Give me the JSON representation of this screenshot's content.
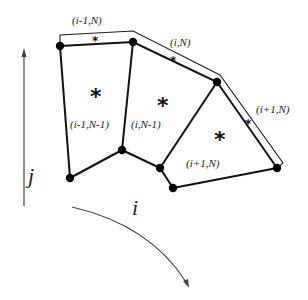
{
  "diagram": {
    "type": "finite-volume-grid-cells",
    "axes": {
      "j_label": "j",
      "i_label": "i"
    },
    "cells": [
      {
        "label": "(i-1,N-1)",
        "center_marker": "*"
      },
      {
        "label": "(i,N-1)",
        "center_marker": "*"
      },
      {
        "label": "(i+1,N)",
        "center_marker": "*"
      }
    ],
    "boundary_strips": [
      {
        "label": "(i-1,N)",
        "marker": "*"
      },
      {
        "label": "(i,N)",
        "marker": "*"
      },
      {
        "label": "(i+1,N)",
        "marker": "*"
      }
    ],
    "colors": {
      "line": "#111111",
      "background": "#ffffff"
    }
  }
}
